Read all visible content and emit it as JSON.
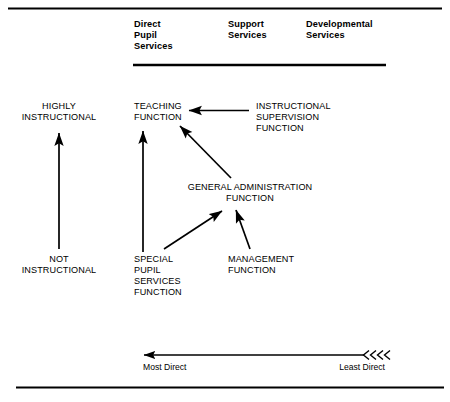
{
  "figure": {
    "type": "diagram",
    "background_color": "#ffffff",
    "ink_color": "#000000"
  },
  "rules": {
    "top_rule_label": "top-horizontal-rule",
    "bottom_rule_label": "bottom-horizontal-rule",
    "header_underline_label": "column-header-underline"
  },
  "columns": [
    {
      "id": "direct-pupil-services",
      "lines": [
        "Direct",
        "Pupil",
        "Services"
      ]
    },
    {
      "id": "support-services",
      "lines": [
        "Support",
        "Services"
      ]
    },
    {
      "id": "developmental-services",
      "lines": [
        "Developmental",
        "Services"
      ]
    }
  ],
  "vertical_scale": {
    "top_label": {
      "lines": [
        "HIGHLY",
        "INSTRUCTIONAL"
      ]
    },
    "bottom_label": {
      "lines": [
        "NOT",
        "INSTRUCTIONAL"
      ]
    },
    "arrow_direction": "up"
  },
  "horizontal_scale": {
    "left_label": "Most Direct",
    "right_label": "Least Direct",
    "arrow_direction": "left",
    "chevron_count": 4
  },
  "nodes": [
    {
      "id": "teaching-function",
      "lines": [
        "TEACHING",
        "FUNCTION"
      ],
      "column": "direct-pupil-services"
    },
    {
      "id": "instructional-supervision-function",
      "lines": [
        "INSTRUCTIONAL",
        "SUPERVISION",
        "FUNCTION"
      ],
      "column": "support-services"
    },
    {
      "id": "general-administration-function",
      "lines": [
        "GENERAL ADMINISTRATION",
        "FUNCTION"
      ],
      "column": "support-services"
    },
    {
      "id": "special-pupil-services-function",
      "lines": [
        "SPECIAL",
        "PUPIL",
        "SERVICES",
        "FUNCTION"
      ],
      "column": "direct-pupil-services"
    },
    {
      "id": "management-function",
      "lines": [
        "MANAGEMENT",
        "FUNCTION"
      ],
      "column": "support-services"
    }
  ],
  "connectors": [
    {
      "id": "supervision-to-teaching",
      "from": "instructional-supervision-function",
      "to": "teaching-function",
      "style": "straight-horizontal"
    },
    {
      "id": "administration-to-teaching",
      "from": "general-administration-function",
      "to": "teaching-function",
      "style": "diagonal"
    },
    {
      "id": "special-pupil-to-teaching",
      "from": "special-pupil-services-function",
      "to": "teaching-function",
      "style": "straight-vertical"
    },
    {
      "id": "special-pupil-to-administration",
      "from": "special-pupil-services-function",
      "to": "general-administration-function",
      "style": "diagonal"
    },
    {
      "id": "management-to-administration",
      "from": "management-function",
      "to": "general-administration-function",
      "style": "diagonal"
    }
  ]
}
